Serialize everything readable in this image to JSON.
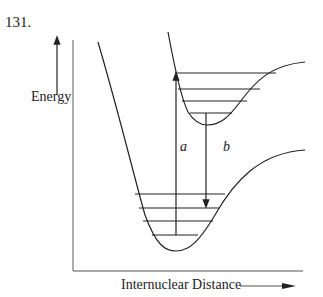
{
  "problem_number": "131.",
  "diagram": {
    "y_axis_label": "Energy",
    "x_axis_label": "Internuclear Distance",
    "transition_a_label": "a",
    "transition_b_label": "b",
    "upper_state_vibrational_levels": 4,
    "lower_state_vibrational_levels": 4,
    "line_color": "#222222"
  }
}
